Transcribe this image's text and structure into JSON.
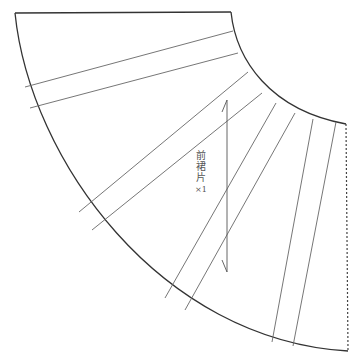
{
  "diagram": {
    "type": "sewing-pattern",
    "piece_label": {
      "chars": [
        "前",
        "裙",
        "片"
      ],
      "quantity": "×1"
    },
    "colors": {
      "outline": "#333333",
      "inner_lines": "#666666",
      "fold_line": "#444444",
      "text": "#555555"
    },
    "outline": {
      "top_left": [
        15,
        13
      ],
      "top_right": [
        231,
        12
      ],
      "inner_arc_end": [
        346,
        124
      ],
      "outer_arc_end": [
        348,
        351
      ]
    },
    "style_lines": [
      {
        "from": [
          25,
          87
        ],
        "to": [
          233,
          31
        ]
      },
      {
        "from": [
          30,
          108
        ],
        "to": [
          238,
          53
        ]
      },
      {
        "from": [
          79,
          212
        ],
        "to": [
          248,
          72
        ]
      },
      {
        "from": [
          92,
          230
        ],
        "to": [
          262,
          93
        ]
      },
      {
        "from": [
          165,
          298
        ],
        "to": [
          276,
          103
        ]
      },
      {
        "from": [
          185,
          310
        ],
        "to": [
          295,
          113
        ]
      },
      {
        "from": [
          272,
          342
        ],
        "to": [
          313,
          119
        ]
      },
      {
        "from": [
          293,
          346
        ],
        "to": [
          336,
          122
        ]
      }
    ],
    "grainline": {
      "x": 227,
      "y_top": 100,
      "y_bottom": 272
    }
  }
}
